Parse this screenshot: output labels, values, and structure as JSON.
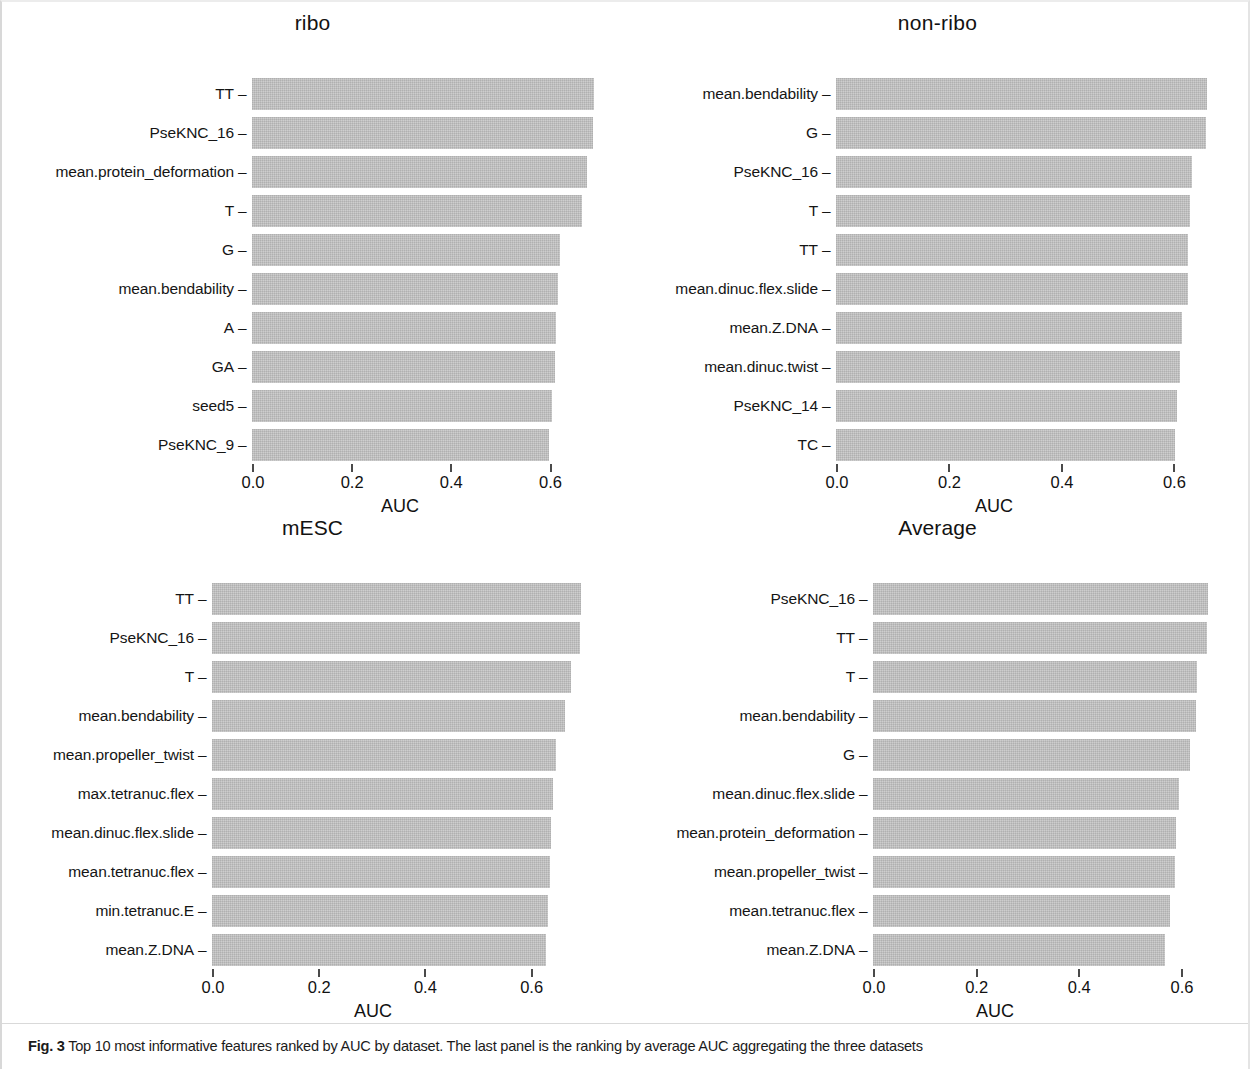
{
  "figure": {
    "caption_label": "Fig. 3",
    "caption_text": "Top 10 most informative features ranked by AUC by dataset. The last panel is the ranking by average AUC aggregating the three datasets",
    "bar_color": "#c2c2c2",
    "text_color": "#111111"
  },
  "chart_data": [
    {
      "type": "bar",
      "orientation": "horizontal",
      "title": "ribo",
      "xlabel": "AUC",
      "ylabel": "",
      "xlim": [
        0.0,
        0.72
      ],
      "xticks": [
        0.0,
        0.2,
        0.4,
        0.6
      ],
      "xticklabels": [
        "0.0",
        "0.2",
        "0.4",
        "0.6"
      ],
      "grid": false,
      "legend": "none",
      "categories": [
        "TT",
        "PseKNC_16",
        "mean.protein_deformation",
        "T",
        "G",
        "mean.bendability",
        "A",
        "GA",
        "seed5",
        "PseKNC_9"
      ],
      "values": [
        0.691,
        0.689,
        0.676,
        0.666,
        0.621,
        0.617,
        0.613,
        0.611,
        0.606,
        0.6
      ]
    },
    {
      "type": "bar",
      "orientation": "horizontal",
      "title": "non-ribo",
      "xlabel": "AUC",
      "ylabel": "",
      "xlim": [
        0.0,
        0.69
      ],
      "xticks": [
        0.0,
        0.2,
        0.4,
        0.6
      ],
      "xticklabels": [
        "0.0",
        "0.2",
        "0.4",
        "0.6"
      ],
      "grid": false,
      "legend": "none",
      "categories": [
        "mean.bendability",
        "G",
        "PseKNC_16",
        "T",
        "TT",
        "mean.dinuc.flex.slide",
        "mean.Z.DNA",
        "mean.dinuc.twist",
        "PseKNC_14",
        "TC"
      ],
      "values": [
        0.66,
        0.658,
        0.633,
        0.63,
        0.626,
        0.626,
        0.616,
        0.612,
        0.607,
        0.604
      ]
    },
    {
      "type": "bar",
      "orientation": "horizontal",
      "title": "mESC",
      "xlabel": "AUC",
      "ylabel": "",
      "xlim": [
        0.0,
        0.725
      ],
      "xticks": [
        0.0,
        0.2,
        0.4,
        0.6
      ],
      "xticklabels": [
        "0.0",
        "0.2",
        "0.4",
        "0.6"
      ],
      "grid": false,
      "legend": "none",
      "categories": [
        "TT",
        "PseKNC_16",
        "T",
        "mean.bendability",
        "mean.propeller_twist",
        "max.tetranuc.flex",
        "mean.dinuc.flex.slide",
        "mean.tetranuc.flex",
        "min.tetranuc.E",
        "mean.Z.DNA"
      ],
      "values": [
        0.696,
        0.694,
        0.676,
        0.666,
        0.649,
        0.642,
        0.64,
        0.638,
        0.634,
        0.63
      ]
    },
    {
      "type": "bar",
      "orientation": "horizontal",
      "title": "Average",
      "xlabel": "AUC",
      "ylabel": "",
      "xlim": [
        0.0,
        0.68
      ],
      "xticks": [
        0.0,
        0.2,
        0.4,
        0.6
      ],
      "xticklabels": [
        "0.0",
        "0.2",
        "0.4",
        "0.6"
      ],
      "grid": false,
      "legend": "none",
      "categories": [
        "PseKNC_16",
        "TT",
        "T",
        "mean.bendability",
        "G",
        "mean.dinuc.flex.slide",
        "mean.protein_deformation",
        "mean.propeller_twist",
        "mean.tetranuc.flex",
        "mean.Z.DNA"
      ],
      "values": [
        0.653,
        0.651,
        0.632,
        0.63,
        0.619,
        0.596,
        0.592,
        0.59,
        0.58,
        0.569
      ]
    }
  ]
}
